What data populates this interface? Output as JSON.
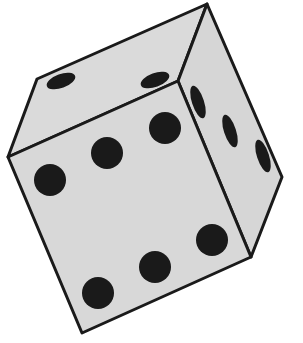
{
  "image": {
    "subject": "die",
    "width": 303,
    "height": 343,
    "colors": {
      "background": "#ffffff",
      "face": "#d8d8d8",
      "outline": "#1a1a1a",
      "pip": "#1a1a1a"
    },
    "faces": {
      "front": {
        "value": 6,
        "pips": 6
      },
      "top": {
        "value": 2,
        "pips": 2
      },
      "right": {
        "value": 3,
        "pips": 3
      }
    }
  }
}
